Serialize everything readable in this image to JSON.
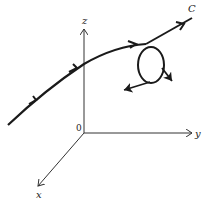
{
  "diagram": {
    "labels": {
      "curve": "C",
      "z_axis": "z",
      "y_axis": "y",
      "x_axis": "x",
      "origin": "0"
    },
    "colors": {
      "ink": "#1a1a1a",
      "axis": "#333333",
      "background": "#ffffff"
    }
  }
}
